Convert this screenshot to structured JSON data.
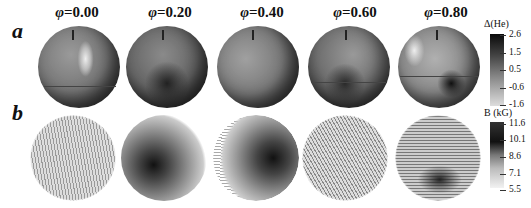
{
  "figure": {
    "panels": [
      {
        "label": "a",
        "quantity": "Δ(He)"
      },
      {
        "label": "b",
        "quantity": "B (kG)"
      }
    ],
    "phases": [
      {
        "symbol": "φ",
        "value": "=0.00"
      },
      {
        "symbol": "φ",
        "value": "=0.20"
      },
      {
        "symbol": "φ",
        "value": "=0.40"
      },
      {
        "symbol": "φ",
        "value": "=0.60"
      },
      {
        "symbol": "φ",
        "value": "=0.80"
      }
    ],
    "colorbar_a": {
      "title": "Δ(He)",
      "ticks": [
        "2.6",
        "1.5",
        "0.5",
        "-0.6",
        "-1.6"
      ]
    },
    "colorbar_b": {
      "title": "B (kG)",
      "ticks": [
        "11.6",
        "10.1",
        "8.6",
        "7.1",
        "5.5"
      ]
    }
  }
}
